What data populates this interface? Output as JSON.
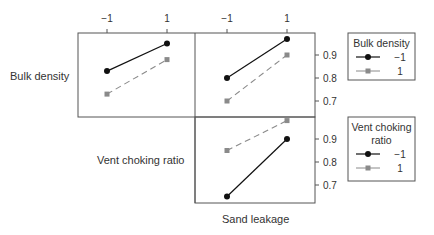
{
  "chart_data": {
    "type": "line",
    "factor_levels": [
      "−1",
      "1"
    ],
    "row_labels": [
      "Bulk density",
      "Vent choking ratio"
    ],
    "column_label": "Sand leakage",
    "y_ticks": [
      "0.9",
      "0.8",
      "0.7"
    ],
    "ylim": [
      0.65,
      1.0
    ],
    "panels": [
      {
        "name": "bulk-density-vs-vent-choking",
        "row": 0,
        "col": 0,
        "trace_factor": "Bulk density",
        "series": [
          {
            "name": "−1",
            "values": [
              0.83,
              0.95
            ]
          },
          {
            "name": "1",
            "values": [
              0.73,
              0.88
            ]
          }
        ]
      },
      {
        "name": "bulk-density-vs-sand-leakage",
        "row": 0,
        "col": 1,
        "trace_factor": "Bulk density",
        "series": [
          {
            "name": "−1",
            "values": [
              0.8,
              0.97
            ]
          },
          {
            "name": "1",
            "values": [
              0.7,
              0.9
            ]
          }
        ]
      },
      {
        "name": "vent-choking-vs-sand-leakage",
        "row": 1,
        "col": 1,
        "trace_factor": "Vent choking ratio",
        "series": [
          {
            "name": "−1",
            "values": [
              0.65,
              0.9
            ]
          },
          {
            "name": "1",
            "values": [
              0.85,
              0.98
            ]
          }
        ]
      }
    ],
    "legends": [
      {
        "title_lines": [
          "Bulk density"
        ],
        "entries": [
          "−1",
          "1"
        ]
      },
      {
        "title_lines": [
          "Vent choking",
          "ratio"
        ],
        "entries": [
          "−1",
          "1"
        ]
      }
    ],
    "colors": {
      "series_neg": "#111111",
      "series_pos": "#8a8a8a",
      "frame": "#555555"
    }
  }
}
